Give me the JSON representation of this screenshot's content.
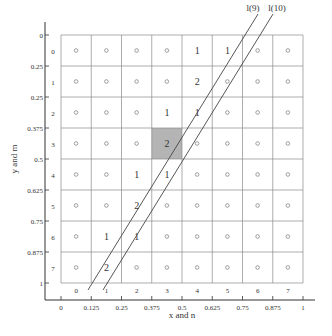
{
  "figure": {
    "line_labels": [
      "l(9)",
      "l(10)"
    ],
    "x_axis": {
      "label": "x and n",
      "ticks": [
        "0",
        "0.125",
        "0.25",
        "0.375",
        "0.5",
        "0.625",
        "0.75",
        "0.875",
        "1"
      ],
      "column_indices": [
        "0",
        "1",
        "2",
        "3",
        "4",
        "5",
        "6",
        "7"
      ]
    },
    "y_axis": {
      "label": "y and m",
      "ticks": [
        "0",
        "0.25",
        "0.25",
        "0.375",
        "0.5",
        "0.625",
        "0.75",
        "0.875",
        "1"
      ],
      "row_indices": [
        "0",
        "1",
        "2",
        "3",
        "4",
        "5",
        "6",
        "7"
      ]
    },
    "grid": {
      "rows": 8,
      "cols": 8,
      "empty_marker": "o",
      "highlight_cell": {
        "row": 3,
        "col": 3,
        "color": "#b4b4b4"
      },
      "cells": [
        [
          "o",
          "o",
          "o",
          "o",
          "1",
          "1",
          "o",
          "o"
        ],
        [
          "o",
          "o",
          "o",
          "o",
          "2",
          "o",
          "o",
          "o"
        ],
        [
          "o",
          "o",
          "o",
          "1",
          "1",
          "o",
          "o",
          "o"
        ],
        [
          "o",
          "o",
          "o",
          "2",
          "o",
          "o",
          "o",
          "o"
        ],
        [
          "o",
          "o",
          "1",
          "1",
          "o",
          "o",
          "o",
          "o"
        ],
        [
          "o",
          "o",
          "2",
          "o",
          "o",
          "o",
          "o",
          "o"
        ],
        [
          "o",
          "1",
          "1",
          "o",
          "o",
          "o",
          "o",
          "o"
        ],
        [
          "o",
          "2",
          "o",
          "o",
          "o",
          "o",
          "o",
          "o"
        ]
      ]
    },
    "colors": {
      "grid_line": "#8a8a8a",
      "axis": "#333333",
      "text": "#333333",
      "marker": "#777777",
      "highlight": "#b4b4b4"
    }
  }
}
